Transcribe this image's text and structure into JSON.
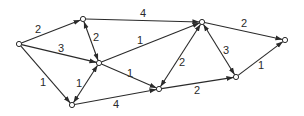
{
  "nodes": [
    {
      "id": "s",
      "x": 19,
      "y": 44
    },
    {
      "id": "a",
      "x": 83,
      "y": 19
    },
    {
      "id": "c",
      "x": 99,
      "y": 63
    },
    {
      "id": "d",
      "x": 72,
      "y": 105
    },
    {
      "id": "e",
      "x": 159,
      "y": 89
    },
    {
      "id": "b",
      "x": 202,
      "y": 22
    },
    {
      "id": "f",
      "x": 236,
      "y": 77
    },
    {
      "id": "t",
      "x": 285,
      "y": 40
    }
  ],
  "edges": [
    {
      "from": "s",
      "to": "a",
      "weight": "2",
      "bidirectional": false,
      "label_x": 38,
      "label_y": 29
    },
    {
      "from": "a",
      "to": "b",
      "weight": "4",
      "bidirectional": false,
      "label_x": 143,
      "label_y": 13
    },
    {
      "from": "s",
      "to": "c",
      "weight": "3",
      "bidirectional": false,
      "label_x": 61,
      "label_y": 48
    },
    {
      "from": "a",
      "to": "c",
      "weight": "2",
      "bidirectional": true,
      "label_x": 96,
      "label_y": 37
    },
    {
      "from": "c",
      "to": "b",
      "weight": "1",
      "bidirectional": false,
      "label_x": 140,
      "label_y": 40
    },
    {
      "from": "c",
      "to": "e",
      "weight": "1",
      "bidirectional": false,
      "label_x": 130,
      "label_y": 73
    },
    {
      "from": "s",
      "to": "d",
      "weight": "1",
      "bidirectional": false,
      "label_x": 43,
      "label_y": 82
    },
    {
      "from": "d",
      "to": "c",
      "weight": "1",
      "bidirectional": true,
      "label_x": 79,
      "label_y": 83
    },
    {
      "from": "d",
      "to": "e",
      "weight": "4",
      "bidirectional": false,
      "label_x": 116,
      "label_y": 104
    },
    {
      "from": "e",
      "to": "b",
      "weight": "2",
      "bidirectional": true,
      "label_x": 182,
      "label_y": 62
    },
    {
      "from": "e",
      "to": "f",
      "weight": "2",
      "bidirectional": false,
      "label_x": 197,
      "label_y": 90
    },
    {
      "from": "b",
      "to": "f",
      "weight": "3",
      "bidirectional": true,
      "label_x": 226,
      "label_y": 50
    },
    {
      "from": "b",
      "to": "t",
      "weight": "2",
      "bidirectional": false,
      "label_x": 244,
      "label_y": 23
    },
    {
      "from": "f",
      "to": "t",
      "weight": "1",
      "bidirectional": false,
      "label_x": 261,
      "label_y": 65
    }
  ],
  "colors": {
    "stroke": "#2a2a2a",
    "background": "#ffffff"
  }
}
